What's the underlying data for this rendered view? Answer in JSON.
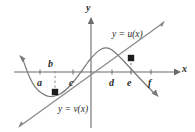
{
  "figure": {
    "kind": "math-graph",
    "background": "#ffffff",
    "stroke_color": "#5a5a5a",
    "text_color": "#2b2b2b",
    "dot_color": "#1a1a1a",
    "axes": {
      "x_label": "x",
      "y_label": "y",
      "x_axis_y": 72,
      "y_axis_x": 91
    },
    "tick_labels": [
      {
        "text": "a",
        "x": 37,
        "y": 78
      },
      {
        "text": "b",
        "x": 48,
        "y": 60
      },
      {
        "text": "c",
        "x": 69,
        "y": 78
      },
      {
        "text": "d",
        "x": 109,
        "y": 78
      },
      {
        "text": "e",
        "x": 127,
        "y": 78
      },
      {
        "text": "f",
        "x": 148,
        "y": 78
      }
    ],
    "curve_labels": [
      {
        "text": "y = u(x)",
        "x": 112,
        "y": 30
      },
      {
        "text": "y = v(x)",
        "x": 58,
        "y": 106
      }
    ],
    "points": [
      {
        "name": "lower-intersection",
        "x": 55,
        "y": 92
      },
      {
        "name": "upper-intersection",
        "x": 131,
        "y": 58
      }
    ],
    "dashed_segments": [
      {
        "name": "b-dashed",
        "x": 55,
        "y1": 72,
        "y2": 92
      },
      {
        "name": "e-dashed",
        "x": 131,
        "y1": 58,
        "y2": 72
      }
    ]
  }
}
